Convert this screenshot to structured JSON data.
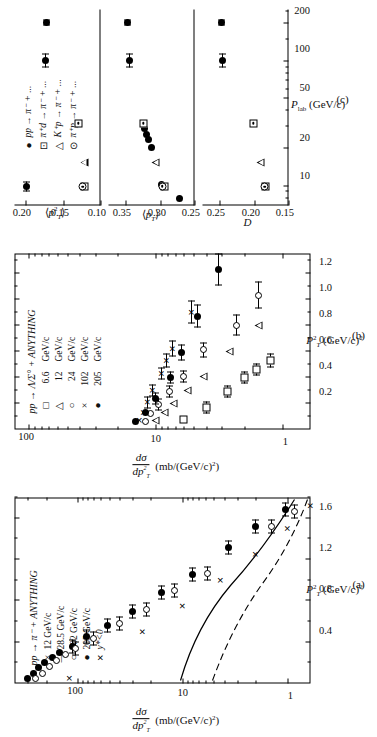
{
  "figure": {
    "kind": "three-panel physics figure",
    "orientation": "rotated 90 degrees counter-clockwise on the page"
  },
  "panel_a": {
    "label": "(a)",
    "reaction": "pp → π⁻ + ANYTHING",
    "extra_condition": "y*<0",
    "xlabel": "P²T (GeV/c)²",
    "ylabel": "dσ/dp²T  (mb/(GeV/c)²)",
    "xticks": [
      "0.4",
      "0.8",
      "1.2",
      "1.6"
    ],
    "yticks": [
      "100",
      "10",
      "1"
    ],
    "legend": [
      {
        "symbol": "×",
        "value": "12 GeV/c"
      },
      {
        "symbol": "—",
        "value": "28.5 GeV/c"
      },
      {
        "symbol": "○",
        "value": "102 GeV/c"
      },
      {
        "symbol": "●",
        "value": "205 GeV/c"
      }
    ]
  },
  "panel_b": {
    "label": "(b)",
    "reaction": "pp → Λ/Σ° + ANYTHING",
    "xlabel": "P²T (GeV/c)²",
    "ylabel": "dσ/dp²T  (mb/(GeV/c)²)",
    "xticks": [
      "0.2",
      "0.4",
      "0.6",
      "0.8",
      "1.0",
      "1.2"
    ],
    "yticks": [
      "100",
      "10",
      "1"
    ],
    "legend": [
      {
        "symbol": "□",
        "value": "6.6",
        "unit": "GeV/c"
      },
      {
        "symbol": "△",
        "value": "12",
        "unit": "GeV/c"
      },
      {
        "symbol": "○",
        "value": "24",
        "unit": "GeV/c"
      },
      {
        "symbol": "×",
        "value": "102",
        "unit": "GeV/c"
      },
      {
        "symbol": "●",
        "value": "205",
        "unit": "GeV/c"
      }
    ]
  },
  "panel_c": {
    "label": "(c)",
    "xlabel": "P lab (GeV/c)",
    "xticks": [
      "10",
      "20",
      "50",
      "100",
      "200"
    ],
    "legend": [
      {
        "symbol": "●",
        "value": "pp → π⁻ + ..."
      },
      {
        "symbol": "⊡",
        "value": "π⁺d → π⁻ + ..."
      },
      {
        "symbol": "△",
        "value": "K⁺p → π⁻ + ..."
      },
      {
        "symbol": "⊙",
        "value": "π⁺p → π⁻ + ..."
      }
    ],
    "subpanels": [
      {
        "ylabel": "⟨p²T⟩",
        "yticks": [
          "0.20",
          "0.15",
          "0.10"
        ]
      },
      {
        "ylabel": "⟨pT⟩",
        "yticks": [
          "0.35",
          "0.30",
          "0.25"
        ]
      },
      {
        "ylabel": "D",
        "yticks": [
          "0.25",
          "0.20",
          "0.15"
        ]
      }
    ]
  },
  "chart_data": [
    {
      "type": "scatter",
      "id": "panel-a",
      "title": "pp → π⁻ + ANYTHING, y*<0",
      "xlabel": "P²T (GeV/c)²",
      "ylabel": "dσ/dp²T (mb/(GeV/c)²)",
      "xlim": [
        0.0,
        1.8
      ],
      "ylim_log": [
        0.6,
        400
      ],
      "yscale": "log",
      "grid": false,
      "legend_position": "upper-right",
      "series": [
        {
          "name": "205 GeV/c",
          "symbol": "filled-circle",
          "points": [
            {
              "x": 0.05,
              "y": 300
            },
            {
              "x": 0.1,
              "y": 265
            },
            {
              "x": 0.15,
              "y": 235
            },
            {
              "x": 0.2,
              "y": 205
            },
            {
              "x": 0.25,
              "y": 175
            },
            {
              "x": 0.3,
              "y": 150
            },
            {
              "x": 0.36,
              "y": 112
            },
            {
              "x": 0.45,
              "y": 82
            },
            {
              "x": 0.56,
              "y": 52
            },
            {
              "x": 0.7,
              "y": 30
            },
            {
              "x": 0.88,
              "y": 16
            },
            {
              "x": 1.05,
              "y": 8.0
            },
            {
              "x": 1.32,
              "y": 3.6
            },
            {
              "x": 1.52,
              "y": 2.0
            },
            {
              "x": 1.68,
              "y": 1.05
            }
          ]
        },
        {
          "name": "102 GeV/c",
          "symbol": "open-circle",
          "points": [
            {
              "x": 0.05,
              "y": 250
            },
            {
              "x": 0.1,
              "y": 215
            },
            {
              "x": 0.16,
              "y": 185
            },
            {
              "x": 0.22,
              "y": 160
            },
            {
              "x": 0.28,
              "y": 130
            },
            {
              "x": 0.34,
              "y": 105
            },
            {
              "x": 0.44,
              "y": 70
            },
            {
              "x": 0.58,
              "y": 40
            },
            {
              "x": 0.72,
              "y": 22
            },
            {
              "x": 0.9,
              "y": 12
            },
            {
              "x": 1.06,
              "y": 5.8
            },
            {
              "x": 1.52,
              "y": 1.4
            },
            {
              "x": 1.66,
              "y": 0.85
            }
          ]
        },
        {
          "name": "12 GeV/c",
          "symbol": "cross-curve",
          "points": [
            {
              "x": 0.05,
              "y": 120
            },
            {
              "x": 0.25,
              "y": 60
            },
            {
              "x": 0.5,
              "y": 24
            },
            {
              "x": 0.75,
              "y": 10
            },
            {
              "x": 1.0,
              "y": 4.3
            },
            {
              "x": 1.25,
              "y": 2.0
            },
            {
              "x": 1.5,
              "y": 1.0
            },
            {
              "x": 1.72,
              "y": 0.6
            }
          ]
        },
        {
          "name": "28.5 GeV/c",
          "symbol": "solid-line",
          "points": [
            {
              "x": 0.05,
              "y": 190
            },
            {
              "x": 0.3,
              "y": 95
            },
            {
              "x": 0.6,
              "y": 40
            },
            {
              "x": 0.9,
              "y": 17
            },
            {
              "x": 1.2,
              "y": 7.5
            },
            {
              "x": 1.5,
              "y": 3.3
            },
            {
              "x": 1.72,
              "y": 2.0
            }
          ]
        }
      ]
    },
    {
      "type": "scatter",
      "id": "panel-b",
      "title": "pp → Λ/Σ° + ANYTHING",
      "xlabel": "P²T (GeV/c)²",
      "ylabel": "dσ/dp²T (mb/(GeV/c)²)",
      "xlim": [
        0.0,
        1.35
      ],
      "ylim_log": [
        0.6,
        130
      ],
      "yscale": "log",
      "grid": false,
      "legend_position": "upper-right",
      "series": [
        {
          "name": "6.6 GeV/c",
          "symbol": "open-square",
          "points": [
            {
              "x": 0.08,
              "y": 6.0
            },
            {
              "x": 0.17,
              "y": 4.0
            },
            {
              "x": 0.29,
              "y": 2.7
            },
            {
              "x": 0.4,
              "y": 2.0
            },
            {
              "x": 0.46,
              "y": 1.6
            },
            {
              "x": 0.53,
              "y": 1.25
            }
          ]
        },
        {
          "name": "12 GeV/c",
          "symbol": "open-triangle",
          "points": [
            {
              "x": 0.07,
              "y": 10.0
            },
            {
              "x": 0.13,
              "y": 8.5
            },
            {
              "x": 0.2,
              "y": 7.2
            },
            {
              "x": 0.3,
              "y": 5.6
            },
            {
              "x": 0.41,
              "y": 4.2
            },
            {
              "x": 0.6,
              "y": 2.6
            },
            {
              "x": 0.8,
              "y": 1.55
            }
          ]
        },
        {
          "name": "24 GeV/c",
          "symbol": "open-circle",
          "points": [
            {
              "x": 0.06,
              "y": 12.0
            },
            {
              "x": 0.12,
              "y": 11.0
            },
            {
              "x": 0.19,
              "y": 9.5
            },
            {
              "x": 0.29,
              "y": 7.8
            },
            {
              "x": 0.41,
              "y": 6.0
            },
            {
              "x": 0.61,
              "y": 4.2
            },
            {
              "x": 0.8,
              "y": 2.3
            },
            {
              "x": 1.03,
              "y": 1.55
            }
          ]
        },
        {
          "name": "102 GeV/c",
          "symbol": "cross",
          "points": [
            {
              "x": 0.07,
              "y": 13.5
            },
            {
              "x": 0.13,
              "y": 12.5
            },
            {
              "x": 0.21,
              "y": 11.5
            },
            {
              "x": 0.3,
              "y": 10.5
            },
            {
              "x": 0.43,
              "y": 9.0
            },
            {
              "x": 0.53,
              "y": 8.2
            },
            {
              "x": 0.62,
              "y": 7.3
            },
            {
              "x": 0.9,
              "y": 5.2
            }
          ]
        },
        {
          "name": "205 GeV/c",
          "symbol": "filled-circle",
          "points": [
            {
              "x": 0.06,
              "y": 14.5
            },
            {
              "x": 0.13,
              "y": 12.0
            },
            {
              "x": 0.24,
              "y": 10.0
            },
            {
              "x": 0.4,
              "y": 7.6
            },
            {
              "x": 0.59,
              "y": 6.2
            },
            {
              "x": 0.87,
              "y": 4.7
            },
            {
              "x": 1.23,
              "y": 3.2
            }
          ]
        }
      ]
    },
    {
      "type": "scatter",
      "id": "panel-c-pt2",
      "title": "⟨p²T⟩ vs P lab",
      "xlabel": "P lab (GeV/c)",
      "ylabel": "⟨p²T⟩",
      "xscale": "log",
      "xlim": [
        7,
        260
      ],
      "ylim": [
        0.1,
        0.215
      ],
      "grid": false,
      "series": [
        {
          "name": "pp → π⁻ + ...",
          "symbol": "filled-circle",
          "points": [
            {
              "x": 9.9,
              "y": 0.199,
              "xerr_lo": 0.8,
              "xerr_hi": 0.9
            },
            {
              "x": 102,
              "y": 0.173,
              "xerr_lo": 12,
              "xerr_hi": 14
            },
            {
              "x": 205,
              "y": 0.172,
              "xerr_lo": 10,
              "xerr_hi": 12
            }
          ]
        },
        {
          "name": "π⁺d → π⁻ + ...",
          "symbol": "dotted-square",
          "points": [
            {
              "x": 9.9,
              "y": 0.122
            },
            {
              "x": 32,
              "y": 0.13
            }
          ]
        },
        {
          "name": "K⁺p → π⁻ + ...",
          "symbol": "open-triangle",
          "points": [
            {
              "x": 15.5,
              "y": 0.122
            }
          ]
        },
        {
          "name": "π⁺p → π⁻ + ...",
          "symbol": "open-dot-circle",
          "points": [
            {
              "x": 9.9,
              "y": 0.124
            }
          ]
        }
      ]
    },
    {
      "type": "scatter",
      "id": "panel-c-pt",
      "title": "⟨pT⟩ vs P lab",
      "xlabel": "P lab (GeV/c)",
      "ylabel": "⟨pT⟩",
      "xscale": "log",
      "xlim": [
        7,
        260
      ],
      "ylim": [
        0.25,
        0.375
      ],
      "grid": false,
      "series": [
        {
          "name": "pp → π⁻ + ...",
          "symbol": "filled-circle",
          "points": [
            {
              "x": 8.0,
              "y": 0.272
            },
            {
              "x": 10.4,
              "y": 0.298
            },
            {
              "x": 20.5,
              "y": 0.312
            },
            {
              "x": 23.5,
              "y": 0.317
            },
            {
              "x": 26.0,
              "y": 0.32
            },
            {
              "x": 29.0,
              "y": 0.322
            },
            {
              "x": 102,
              "y": 0.345,
              "xerr_lo": 12,
              "xerr_hi": 14
            },
            {
              "x": 205,
              "y": 0.348,
              "xerr_lo": 12,
              "xerr_hi": 13
            }
          ]
        },
        {
          "name": "π⁺d → π⁻ + ...",
          "symbol": "dotted-square",
          "points": [
            {
              "x": 10.0,
              "y": 0.294
            },
            {
              "x": 32,
              "y": 0.324
            }
          ]
        },
        {
          "name": "K⁺p → π⁻ + ...",
          "symbol": "open-triangle",
          "points": [
            {
              "x": 15.5,
              "y": 0.306
            }
          ]
        },
        {
          "name": "π⁺p → π⁻ + ...",
          "symbol": "open-dot-circle",
          "points": [
            {
              "x": 10.0,
              "y": 0.297
            }
          ]
        }
      ]
    },
    {
      "type": "scatter",
      "id": "panel-c-D",
      "title": "D vs P lab",
      "xlabel": "P lab (GeV/c)",
      "ylabel": "D",
      "xscale": "log",
      "xlim": [
        7,
        260
      ],
      "ylim": [
        0.15,
        0.275
      ],
      "grid": false,
      "series": [
        {
          "name": "pp → π⁻ + ...",
          "symbol": "filled-circle",
          "points": [
            {
              "x": 102,
              "y": 0.246,
              "xerr_lo": 12,
              "xerr_hi": 14
            },
            {
              "x": 205,
              "y": 0.248,
              "xerr_lo": 10,
              "xerr_hi": 12
            }
          ]
        },
        {
          "name": "π⁺d → π⁻ + ...",
          "symbol": "dotted-square",
          "points": [
            {
              "x": 9.9,
              "y": 0.183
            },
            {
              "x": 32,
              "y": 0.201
            }
          ]
        },
        {
          "name": "K⁺p → π⁻ + ...",
          "symbol": "open-triangle",
          "points": [
            {
              "x": 15.5,
              "y": 0.19
            }
          ]
        },
        {
          "name": "π⁺p → π⁻ + ...",
          "symbol": "open-dot-circle",
          "points": [
            {
              "x": 9.9,
              "y": 0.185
            }
          ]
        }
      ]
    }
  ]
}
